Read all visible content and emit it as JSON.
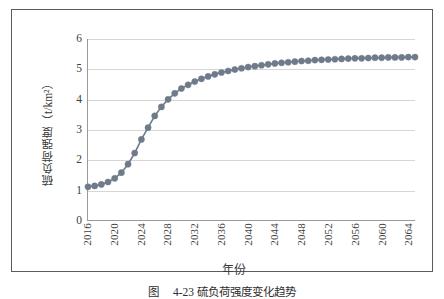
{
  "figure": {
    "caption_label": "图",
    "caption_number": "4-23",
    "caption_text": "硫负荷强度变化趋势"
  },
  "chart_data": {
    "type": "line",
    "title": "",
    "subtitle": "",
    "xlabel": "年份",
    "ylabel": "硫负荷强度（t/km²）",
    "ylabel_text": "硫负荷强度",
    "ylabel_unit": "（t/km²）",
    "grid": true,
    "legend": "none",
    "marker": "circle",
    "marker_color": "#6f7b8a",
    "line_color": "#6f7b8a",
    "xlim": [
      2016,
      2065
    ],
    "ylim": [
      0,
      6
    ],
    "yticks": [
      0,
      1,
      2,
      3,
      4,
      5,
      6
    ],
    "ytick_labels": [
      "0",
      "1",
      "2",
      "3",
      "4",
      "5",
      "6"
    ],
    "xticks": [
      2016,
      2020,
      2024,
      2028,
      2032,
      2036,
      2040,
      2044,
      2048,
      2052,
      2056,
      2060,
      2064
    ],
    "xtick_labels": [
      "2016",
      "2020",
      "2024",
      "2028",
      "2032",
      "2036",
      "2040",
      "2044",
      "2048",
      "2052",
      "2056",
      "2060",
      "2064"
    ],
    "x": [
      2016,
      2017,
      2018,
      2019,
      2020,
      2021,
      2022,
      2023,
      2024,
      2025,
      2026,
      2027,
      2028,
      2029,
      2030,
      2031,
      2032,
      2033,
      2034,
      2035,
      2036,
      2037,
      2038,
      2039,
      2040,
      2041,
      2042,
      2043,
      2044,
      2045,
      2046,
      2047,
      2048,
      2049,
      2050,
      2051,
      2052,
      2053,
      2054,
      2055,
      2056,
      2057,
      2058,
      2059,
      2060,
      2061,
      2062,
      2063,
      2064,
      2065
    ],
    "values": [
      1.1,
      1.13,
      1.18,
      1.26,
      1.38,
      1.57,
      1.85,
      2.22,
      2.67,
      3.06,
      3.45,
      3.75,
      4.0,
      4.2,
      4.36,
      4.48,
      4.59,
      4.68,
      4.76,
      4.83,
      4.89,
      4.94,
      4.99,
      5.03,
      5.07,
      5.1,
      5.13,
      5.16,
      5.19,
      5.21,
      5.23,
      5.25,
      5.27,
      5.28,
      5.3,
      5.31,
      5.32,
      5.33,
      5.34,
      5.35,
      5.36,
      5.36,
      5.37,
      5.38,
      5.38,
      5.39,
      5.39,
      5.39,
      5.4,
      5.4
    ],
    "series": [
      {
        "name": "硫负荷强度",
        "values": [
          1.1,
          1.13,
          1.18,
          1.26,
          1.38,
          1.57,
          1.85,
          2.22,
          2.67,
          3.06,
          3.45,
          3.75,
          4.0,
          4.2,
          4.36,
          4.48,
          4.59,
          4.68,
          4.76,
          4.83,
          4.89,
          4.94,
          4.99,
          5.03,
          5.07,
          5.1,
          5.13,
          5.16,
          5.19,
          5.21,
          5.23,
          5.25,
          5.27,
          5.28,
          5.3,
          5.31,
          5.32,
          5.33,
          5.34,
          5.35,
          5.36,
          5.36,
          5.37,
          5.38,
          5.38,
          5.39,
          5.39,
          5.39,
          5.4,
          5.4
        ]
      }
    ]
  }
}
